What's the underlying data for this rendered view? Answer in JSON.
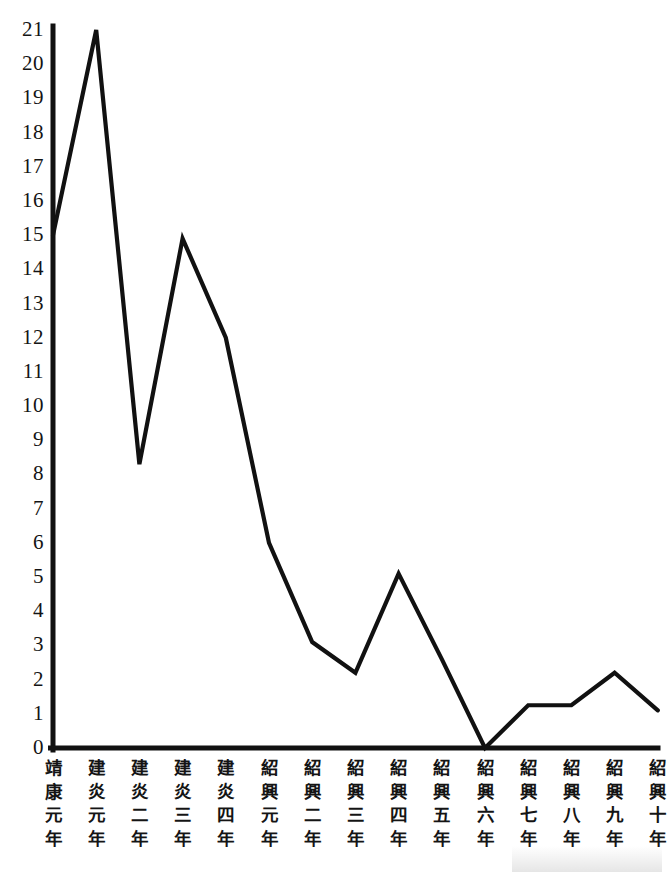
{
  "chart_data": {
    "type": "line",
    "title": "",
    "subtitle": "",
    "xlabel": "",
    "ylabel": "",
    "grid": false,
    "legend": "none",
    "xlim": [
      0,
      14
    ],
    "ylim": [
      0,
      21
    ],
    "y_ticks": [
      0,
      1,
      2,
      3,
      4,
      5,
      6,
      7,
      8,
      9,
      10,
      11,
      12,
      13,
      14,
      15,
      16,
      17,
      18,
      19,
      20,
      21
    ],
    "y_tick_labels": [
      "0",
      "1",
      "2",
      "3",
      "4",
      "5",
      "6",
      "7",
      "8",
      "9",
      "10",
      "11",
      "12",
      "13",
      "14",
      "15",
      "16",
      "17",
      "18",
      "19",
      "20",
      "21"
    ],
    "categories": [
      "靖康元年",
      "建炎元年",
      "建炎二年",
      "建炎三年",
      "建炎四年",
      "紹興元年",
      "紹興二年",
      "紹興三年",
      "紹興四年",
      "紹興五年",
      "紹興六年",
      "紹興七年",
      "紹興八年",
      "紹興九年",
      "紹興十年"
    ],
    "values": [
      15,
      21,
      8.3,
      14.9,
      12,
      6,
      3.1,
      2.2,
      5.1,
      2.6,
      0,
      1.25,
      1.25,
      2.2,
      1.1
    ],
    "series": [
      {
        "name": "",
        "values": [
          15,
          21,
          8.3,
          14.9,
          12,
          6,
          3.1,
          2.2,
          5.1,
          2.6,
          0,
          1.25,
          1.25,
          2.2,
          1.1
        ]
      }
    ],
    "line_color": "#111111",
    "axis_color": "#111111"
  },
  "axes": {
    "y_labels": [
      "21",
      "20",
      "19",
      "18",
      "17",
      "16",
      "15",
      "14",
      "13",
      "12",
      "11",
      "10",
      "9",
      "8",
      "7",
      "6",
      "5",
      "4",
      "3",
      "2",
      "1",
      "0"
    ],
    "x_labels": [
      {
        "chars": [
          "靖",
          "康",
          "元",
          "年"
        ]
      },
      {
        "chars": [
          "建",
          "炎",
          "元",
          "年"
        ]
      },
      {
        "chars": [
          "建",
          "炎",
          "二",
          "年"
        ]
      },
      {
        "chars": [
          "建",
          "炎",
          "三",
          "年"
        ]
      },
      {
        "chars": [
          "建",
          "炎",
          "四",
          "年"
        ]
      },
      {
        "chars": [
          "紹",
          "興",
          "元",
          "年"
        ]
      },
      {
        "chars": [
          "紹",
          "興",
          "二",
          "年"
        ]
      },
      {
        "chars": [
          "紹",
          "興",
          "三",
          "年"
        ]
      },
      {
        "chars": [
          "紹",
          "興",
          "四",
          "年"
        ]
      },
      {
        "chars": [
          "紹",
          "興",
          "五",
          "年"
        ]
      },
      {
        "chars": [
          "紹",
          "興",
          "六",
          "年"
        ]
      },
      {
        "chars": [
          "紹",
          "興",
          "七",
          "年"
        ]
      },
      {
        "chars": [
          "紹",
          "興",
          "八",
          "年"
        ]
      },
      {
        "chars": [
          "紹",
          "興",
          "九",
          "年"
        ]
      },
      {
        "chars": [
          "紹",
          "興",
          "十",
          "年"
        ]
      }
    ]
  },
  "colors": {
    "line": "#111111",
    "axis": "#111111",
    "background": "#ffffff",
    "text": "#141414"
  }
}
